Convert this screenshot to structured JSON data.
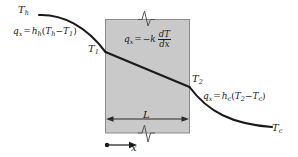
{
  "figure": {
    "name": "conduction-convection-temperature-distribution",
    "background_color": "#ffffff",
    "slab_fill_color": "#c9c9c9",
    "slab_border_color": "#808080",
    "curve_color": "#1a1a1a"
  },
  "labels": {
    "t_hot": {
      "symbol": "T",
      "subscript": "h"
    },
    "t_cold": {
      "symbol": "T",
      "subscript": "c"
    },
    "t_surface_1": {
      "symbol": "T",
      "subscript": "1"
    },
    "t_surface_2": {
      "symbol": "T",
      "subscript": "2"
    },
    "thickness": {
      "symbol": "L"
    },
    "axis_x": {
      "symbol": "x"
    }
  },
  "equations": {
    "hot_convection": {
      "flux": "q",
      "flux_sub": "x",
      "equals": "=",
      "coeff": "h",
      "coeff_sub": "h",
      "open_paren": "(",
      "term1": "T",
      "term1_sub": "h",
      "minus": "−",
      "term2": "T",
      "term2_sub": "1",
      "close_paren": ")"
    },
    "conduction": {
      "flux": "q",
      "flux_sub": "x",
      "equals": "=",
      "minus_k": "−",
      "k": "k",
      "numerator": "dT",
      "denominator": "dx"
    },
    "cold_convection": {
      "flux": "q",
      "flux_sub": "x",
      "equals": "=",
      "coeff": "h",
      "coeff_sub": "c",
      "open_paren": "(",
      "term1": "T",
      "term1_sub": "2",
      "minus": "−",
      "term2": "T",
      "term2_sub": "c",
      "close_paren": ")"
    }
  }
}
